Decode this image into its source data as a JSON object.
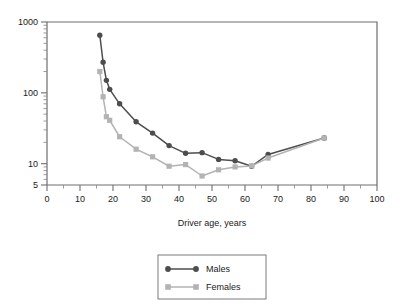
{
  "chart_data": {
    "type": "line",
    "title": "",
    "xlabel": "Driver age, years",
    "ylabel": "",
    "xlim": [
      0,
      100
    ],
    "ylim": [
      5,
      1000
    ],
    "yscale": "log",
    "grid": false,
    "legend_position": "bottom-center",
    "x_ticks": [
      0,
      10,
      20,
      30,
      40,
      50,
      60,
      70,
      80,
      90,
      100
    ],
    "x_tick_labels": [
      "0",
      "10",
      "20",
      "30",
      "40",
      "50",
      "60",
      "70",
      "80",
      "90",
      "100"
    ],
    "x_minor_step": 5,
    "y_ticks": [
      5,
      10,
      100,
      1000
    ],
    "y_tick_labels": [
      "5",
      "10",
      "100",
      "1000"
    ],
    "series": [
      {
        "name": "Males",
        "color": "#4d4d4d",
        "marker": "circle",
        "x": [
          16,
          17,
          18,
          19,
          22,
          27,
          32,
          37,
          42,
          47,
          52,
          57,
          62,
          67,
          84
        ],
        "y": [
          650,
          270,
          150,
          112,
          70,
          39,
          27,
          18,
          14,
          14.3,
          11.5,
          11,
          9.2,
          13.5,
          23
        ]
      },
      {
        "name": "Females",
        "color": "#b3b3b3",
        "marker": "square",
        "x": [
          16,
          17,
          18,
          19,
          22,
          27,
          32,
          37,
          42,
          47,
          52,
          57,
          62,
          67,
          84
        ],
        "y": [
          200,
          88,
          46,
          41,
          24,
          16,
          12.5,
          9.2,
          9.7,
          6.7,
          8.2,
          9.0,
          9.3,
          12,
          23
        ]
      }
    ]
  },
  "legend": {
    "entries": [
      {
        "label": "Males"
      },
      {
        "label": "Females"
      }
    ]
  },
  "axis": {
    "x_title": "Driver age, years"
  }
}
